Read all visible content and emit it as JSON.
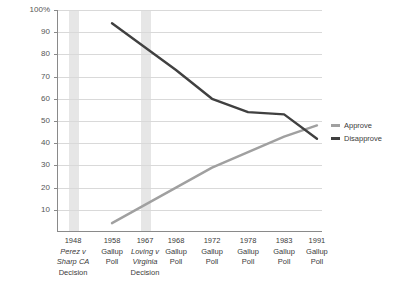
{
  "chart_data": {
    "type": "line",
    "title": "",
    "xlabel": "",
    "ylabel": "",
    "ylim": [
      0,
      100
    ],
    "grid": true,
    "legend_position": "right",
    "categories": [
      "1948 Perez v Sharp CA Decision",
      "1958 Gallup Poll",
      "1967 Loving v Virginia Decision",
      "1968 Gallup Poll",
      "1972 Gallup Poll",
      "1978 Gallup Poll",
      "1983 Gallup Poll",
      "1991 Gallup Poll"
    ],
    "x_points": [
      "1958",
      "1968",
      "1972",
      "1978",
      "1983",
      "1991"
    ],
    "series": [
      {
        "name": "Approve",
        "color": "#a0a0a0",
        "x": [
          "1958",
          "1968",
          "1972",
          "1978",
          "1983",
          "1991"
        ],
        "values": [
          4,
          20,
          29,
          36,
          43,
          48
        ]
      },
      {
        "name": "Disapprove",
        "color": "#404040",
        "x": [
          "1958",
          "1968",
          "1972",
          "1978",
          "1983",
          "1991"
        ],
        "values": [
          94,
          73,
          60,
          54,
          53,
          42
        ]
      }
    ],
    "y_ticks": [
      "100%",
      "90",
      "80",
      "70",
      "60",
      "50",
      "40",
      "30",
      "20",
      "10"
    ],
    "y_tick_values": [
      100,
      90,
      80,
      70,
      60,
      50,
      40,
      30,
      20,
      10
    ],
    "event_bands": [
      {
        "label": "1948 Perez v Sharp CA Decision",
        "x": "1948"
      },
      {
        "label": "1967 Loving v Virginia Decision",
        "x": "1967"
      }
    ]
  },
  "axis": {
    "y_ticks": [
      {
        "label": "100%",
        "value": 100
      },
      {
        "label": "90",
        "value": 90
      },
      {
        "label": "80",
        "value": 80
      },
      {
        "label": "70",
        "value": 70
      },
      {
        "label": "60",
        "value": 60
      },
      {
        "label": "50",
        "value": 50
      },
      {
        "label": "40",
        "value": 40
      },
      {
        "label": "30",
        "value": 30
      },
      {
        "label": "20",
        "value": 20
      },
      {
        "label": "10",
        "value": 10
      }
    ],
    "x_labels": [
      {
        "year": "1948",
        "line2": "Perez v",
        "line3": "Sharp CA",
        "line4": "Decision",
        "event": true,
        "pos": 0.0605
      },
      {
        "year": "1958",
        "line2": "Gallup",
        "line3": "Poll",
        "line4": "",
        "event": false,
        "pos": 0.2075
      },
      {
        "year": "1967",
        "line2": "Loving v",
        "line3": "Virginia",
        "line4": "Decision",
        "event": true,
        "pos": 0.332
      },
      {
        "year": "1968",
        "line2": "Gallup",
        "line3": "Poll",
        "line4": "",
        "event": false,
        "pos": 0.449
      },
      {
        "year": "1972",
        "line2": "Gallup",
        "line3": "Poll",
        "line4": "",
        "event": false,
        "pos": 0.585
      },
      {
        "year": "1978",
        "line2": "Gallup",
        "line3": "Poll",
        "line4": "",
        "event": false,
        "pos": 0.721
      },
      {
        "year": "1983",
        "line2": "Gallup",
        "line3": "Poll",
        "line4": "",
        "event": false,
        "pos": 0.857
      },
      {
        "year": "1991",
        "line2": "Gallup",
        "line3": "Poll",
        "line4": "",
        "event": false,
        "pos": 0.981
      }
    ]
  },
  "legend": {
    "items": [
      {
        "label": "Approve",
        "color": "#a0a0a0"
      },
      {
        "label": "Disapprove",
        "color": "#404040"
      }
    ]
  },
  "colors": {
    "approve": "#a0a0a0",
    "disapprove": "#404040",
    "grid": "#d9d9d9",
    "axis": "#8a8a8a",
    "band": "#e6e6e6",
    "background": "#ffffff"
  }
}
